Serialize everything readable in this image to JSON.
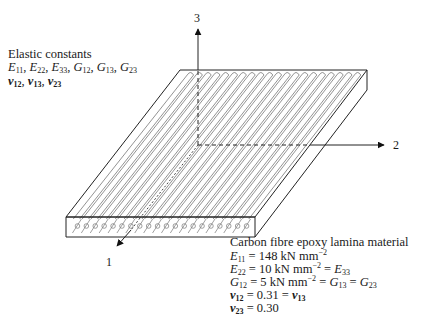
{
  "figure": {
    "type": "diagram",
    "axes": [
      {
        "id": "1",
        "label": "1",
        "direction": "fibre direction (out of page, toward viewer)"
      },
      {
        "id": "2",
        "label": "2",
        "direction": "transverse in-plane"
      },
      {
        "id": "3",
        "label": "3",
        "direction": "through thickness"
      }
    ],
    "fibre_count": 20
  },
  "left_note": {
    "title": "Elastic constants",
    "line1": [
      {
        "sym": "E",
        "sub": "11"
      },
      {
        "sym": "E",
        "sub": "22"
      },
      {
        "sym": "E",
        "sub": "33"
      },
      {
        "sym": "G",
        "sub": "12"
      },
      {
        "sym": "G",
        "sub": "13"
      },
      {
        "sym": "G",
        "sub": "23"
      }
    ],
    "line2": [
      {
        "sym": "ν",
        "sub": "12"
      },
      {
        "sym": "ν",
        "sub": "13"
      },
      {
        "sym": "ν",
        "sub": "23"
      }
    ]
  },
  "material_note": {
    "title": "Carbon fibre epoxy lamina material",
    "E11": {
      "sym": "E",
      "sub": "11",
      "value": "148 kN mm",
      "exp": "−2"
    },
    "E22": {
      "sym": "E",
      "sub": "22",
      "value": "10 kN mm",
      "exp": "−2",
      "equals_sym": "E",
      "equals_sub": "33"
    },
    "G12": {
      "sym": "G",
      "sub": "12",
      "value": "5 kN mm",
      "exp": "−2",
      "eq1_sym": "G",
      "eq1_sub": "13",
      "eq2_sym": "G",
      "eq2_sub": "23"
    },
    "v12": {
      "sym": "ν",
      "sub": "12",
      "value": "0.31",
      "equals_sym": "ν",
      "equals_sub": "13"
    },
    "v23": {
      "sym": "ν",
      "sub": "23",
      "value": "0.30"
    }
  },
  "symbols": {
    "eq": " = ",
    "comma": ", "
  }
}
